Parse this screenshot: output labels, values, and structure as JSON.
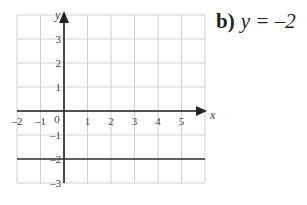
{
  "question": {
    "label": "b)",
    "equation": "y = –2"
  },
  "chart_data": {
    "type": "line",
    "title": "y = –2",
    "xlabel": "x",
    "ylabel": "y",
    "xlim": [
      -2,
      6
    ],
    "ylim": [
      -3,
      4
    ],
    "x_ticks": [
      -2,
      -1,
      0,
      1,
      2,
      3,
      4,
      5
    ],
    "y_ticks": [
      -3,
      -2,
      -1,
      1,
      2,
      3
    ],
    "grid": true,
    "series": [
      {
        "name": "y = -2",
        "x": [
          -2,
          6
        ],
        "y": [
          -2,
          -2
        ]
      }
    ]
  },
  "colors": {
    "grid": "#cfcfcf",
    "axis": "#222222",
    "line": "#333333",
    "text": "#444444"
  }
}
